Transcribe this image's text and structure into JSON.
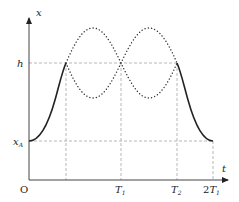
{
  "diagram": {
    "axes": {
      "y_label": "x",
      "x_label": "t",
      "origin_label": "O"
    },
    "y_ticks": [
      {
        "label": "h",
        "sub": ""
      },
      {
        "label": "x",
        "sub": "A"
      }
    ],
    "x_ticks": [
      {
        "label": "T",
        "sub": "1",
        "prefix": ""
      },
      {
        "label": "T",
        "sub": "2",
        "prefix": ""
      },
      {
        "label": "T",
        "sub": "1",
        "prefix": "2"
      }
    ],
    "curves": [
      {
        "name": "solid-rise",
        "style": "solid",
        "description": "rises from x_A at t=0 to h"
      },
      {
        "name": "dotted-upper",
        "style": "dotted",
        "description": "sinusoid peak-trough-peak between h levels"
      },
      {
        "name": "dotted-lower",
        "style": "dotted",
        "description": "sinusoid trough-peak-trough between h levels"
      },
      {
        "name": "solid-fall",
        "style": "solid",
        "description": "falls from h at T2 to x_A at 2T1"
      }
    ],
    "colors": {
      "ink": "#222222",
      "dashed": "#999999"
    }
  }
}
